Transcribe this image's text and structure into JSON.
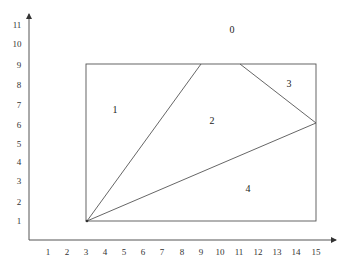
{
  "diagram": {
    "type": "planar-subdivision",
    "x_axis": {
      "ticks": [
        "1",
        "2",
        "3",
        "4",
        "5",
        "6",
        "7",
        "8",
        "9",
        "10",
        "11",
        "12",
        "13",
        "14",
        "15"
      ]
    },
    "y_axis": {
      "ticks": [
        "1",
        "2",
        "3",
        "4",
        "5",
        "6",
        "7",
        "8",
        "9",
        "10",
        "11"
      ]
    },
    "rectangle": {
      "x_min": 3,
      "x_max": 15,
      "y_min": 1,
      "y_max": 9
    },
    "vertices": [
      {
        "x": 3,
        "y": 1
      },
      {
        "x": 9,
        "y": 9
      },
      {
        "x": 11,
        "y": 9
      },
      {
        "x": 15,
        "y": 6
      }
    ],
    "segments": [
      {
        "from": [
          3,
          1
        ],
        "to": [
          9,
          9
        ]
      },
      {
        "from": [
          3,
          1
        ],
        "to": [
          15,
          6
        ]
      },
      {
        "from": [
          11,
          9
        ],
        "to": [
          15,
          6
        ]
      }
    ],
    "regions": [
      {
        "label": "0",
        "x": 11,
        "y": 10.7
      },
      {
        "label": "1",
        "x": 4.5,
        "y": 6.7
      },
      {
        "label": "2",
        "x": 9.6,
        "y": 6.1
      },
      {
        "label": "3",
        "x": 13.6,
        "y": 8.0
      },
      {
        "label": "4",
        "x": 11.5,
        "y": 2.6
      }
    ]
  }
}
